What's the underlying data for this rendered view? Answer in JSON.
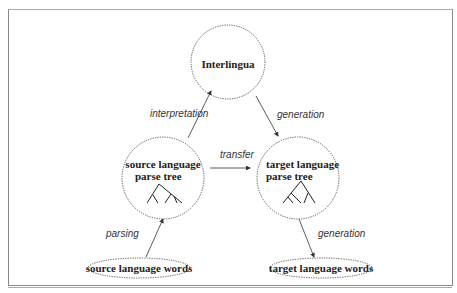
{
  "nodes": {
    "interlingua": {
      "label": "Interlingua"
    },
    "source_tree": {
      "line1": "source language",
      "line2": "parse tree"
    },
    "target_tree": {
      "line1": "target language",
      "line2": "parse tree"
    },
    "source_words": {
      "label": "source language words"
    },
    "target_words": {
      "label": "target language words"
    }
  },
  "edges": {
    "interpretation": "interpretation",
    "generation_top": "generation",
    "transfer": "transfer",
    "parsing": "parsing",
    "generation_bottom": "generation"
  },
  "colors": {
    "stroke": "#333333",
    "dotted": "#555555",
    "frame": "#888888"
  }
}
